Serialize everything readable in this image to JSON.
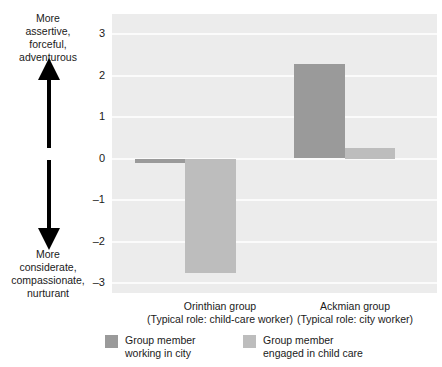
{
  "chart_data": {
    "type": "bar",
    "title": "",
    "xlabel": "",
    "ylabel": "",
    "ylim": [
      -3,
      3
    ],
    "yticks": [
      "3",
      "2",
      "1",
      "0",
      "-1",
      "-2",
      "-3"
    ],
    "ytick_values": [
      3,
      2,
      1,
      0,
      -1,
      -2,
      -3
    ],
    "grid": true,
    "legend_position": "bottom",
    "categories": [
      "Orinthian group (Typical role: child-care worker)",
      "Ackmian group (Typical role: city worker)"
    ],
    "category_lines": [
      {
        "line1": "Orinthian group",
        "line2": "(Typical role: child-care worker)"
      },
      {
        "line1": "Ackmian group",
        "line2": "(Typical role: city worker)"
      }
    ],
    "series": [
      {
        "name": "Group member working in city",
        "name_line1": "Group member",
        "name_line2": "working in city",
        "color": "#9a9a9a",
        "values": [
          -0.1,
          2.28
        ]
      },
      {
        "name": "Group member engaged in child care",
        "name_line1": "Group member",
        "name_line2": "engaged in child care",
        "color": "#bdbdbd",
        "values": [
          -2.75,
          0.25
        ]
      }
    ],
    "axis_annotation": {
      "top": [
        "More",
        "assertive,",
        "forceful,",
        "adventurous"
      ],
      "bottom": [
        "More",
        "considerate,",
        "compassionate,",
        "nurturant"
      ],
      "arrow_up": "up-arrow",
      "arrow_down": "down-arrow"
    },
    "plot_background": "#ececec",
    "gridline_color": "#fbfbfb"
  }
}
